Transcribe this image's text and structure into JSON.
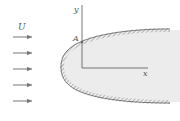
{
  "diagram": {
    "labels": {
      "free_stream": "U",
      "stagnation_point": "A",
      "x_axis": "x",
      "y_axis": "y"
    },
    "flow_arrows": {
      "count": 5,
      "direction": "right"
    },
    "colors": {
      "line": "#666666",
      "body_fill": "#ececec",
      "hatch": "#777777",
      "arrow": "#777777"
    }
  }
}
